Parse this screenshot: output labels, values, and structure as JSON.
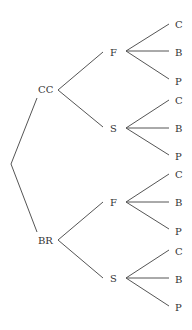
{
  "diagram": {
    "type": "tree",
    "title": "",
    "root": {
      "children": [
        {
          "label": "CC",
          "children": [
            {
              "label": "F",
              "children": [
                {
                  "label": "C"
                },
                {
                  "label": "B"
                },
                {
                  "label": "P"
                }
              ]
            },
            {
              "label": "S",
              "children": [
                {
                  "label": "C"
                },
                {
                  "label": "B"
                },
                {
                  "label": "P"
                }
              ]
            }
          ]
        },
        {
          "label": "BR",
          "children": [
            {
              "label": "F",
              "children": [
                {
                  "label": "C"
                },
                {
                  "label": "B"
                },
                {
                  "label": "P"
                }
              ]
            },
            {
              "label": "S",
              "children": [
                {
                  "label": "C"
                },
                {
                  "label": "B"
                },
                {
                  "label": "P"
                }
              ]
            }
          ]
        }
      ]
    },
    "level1": [
      "CC",
      "BR"
    ],
    "level2": [
      "F",
      "S"
    ],
    "level3": [
      "C",
      "B",
      "P"
    ]
  }
}
